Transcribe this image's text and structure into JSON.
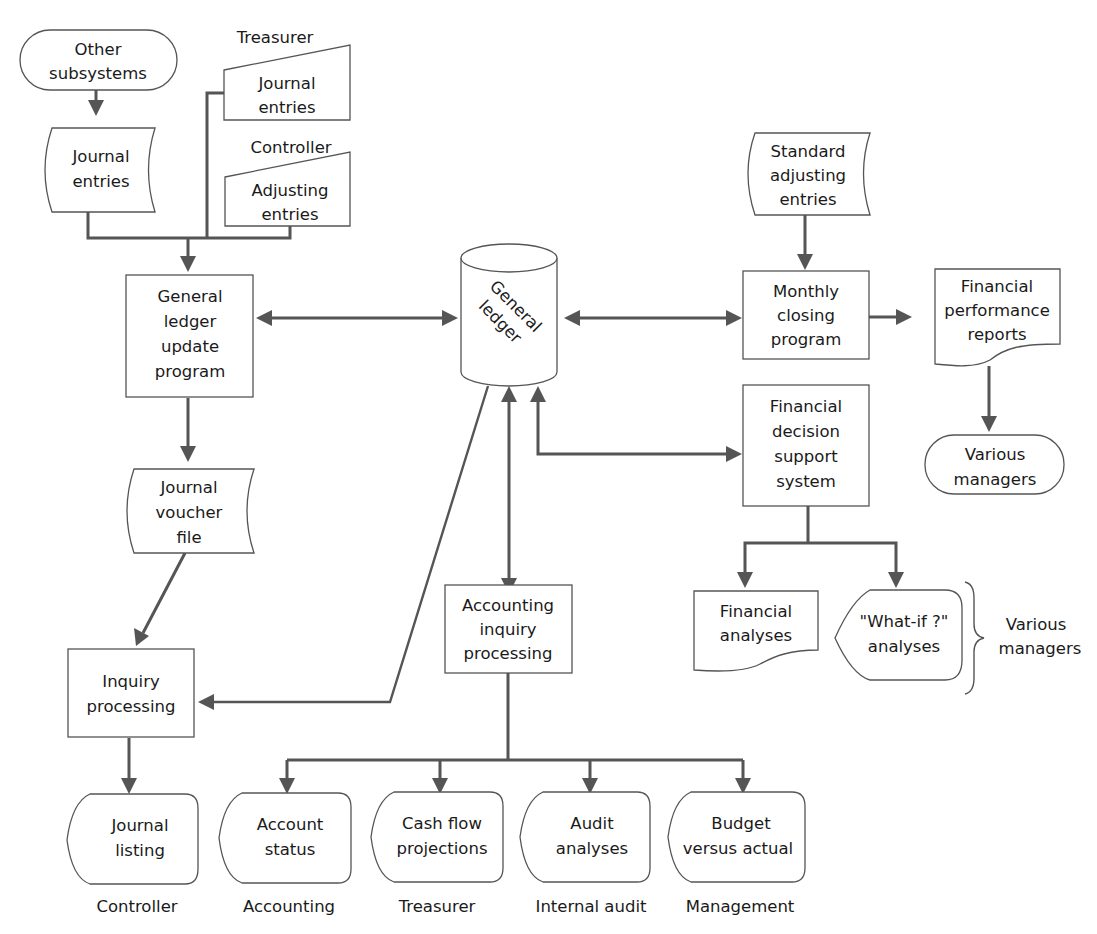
{
  "diagram": {
    "type": "flowchart",
    "colors": {
      "line": "#555555",
      "text": "#1a1a1a",
      "background": "#ffffff"
    },
    "nodes": {
      "other_subsystems": {
        "shape": "terminal",
        "lines": [
          "Other",
          "subsystems"
        ]
      },
      "journal_entries_left": {
        "shape": "stored-data",
        "lines": [
          "Journal",
          "entries"
        ]
      },
      "treasurer_label": {
        "shape": "label",
        "lines": [
          "Treasurer"
        ]
      },
      "treasurer_journal_entries": {
        "shape": "manual-input",
        "lines": [
          "Journal",
          "entries"
        ]
      },
      "controller_label": {
        "shape": "label",
        "lines": [
          "Controller"
        ]
      },
      "controller_adjusting_entries": {
        "shape": "manual-input",
        "lines": [
          "Adjusting",
          "entries"
        ]
      },
      "gl_update_program": {
        "shape": "process",
        "lines": [
          "General",
          "ledger",
          "update",
          "program"
        ]
      },
      "general_ledger": {
        "shape": "database",
        "lines": [
          "General",
          "ledger"
        ]
      },
      "standard_adjusting_entries": {
        "shape": "stored-data",
        "lines": [
          "Standard",
          "adjusting",
          "entries"
        ]
      },
      "monthly_closing_program": {
        "shape": "process",
        "lines": [
          "Monthly",
          "closing",
          "program"
        ]
      },
      "financial_performance_reports": {
        "shape": "document",
        "lines": [
          "Financial",
          "performance",
          "reports"
        ]
      },
      "various_managers_top": {
        "shape": "terminal",
        "lines": [
          "Various",
          "managers"
        ]
      },
      "financial_dss": {
        "shape": "process",
        "lines": [
          "Financial",
          "decision",
          "support",
          "system"
        ]
      },
      "financial_analyses": {
        "shape": "document",
        "lines": [
          "Financial",
          "analyses"
        ]
      },
      "what_if_analyses": {
        "shape": "display",
        "lines": [
          "\"What-if ?\"",
          "analyses"
        ]
      },
      "various_managers_brace": {
        "shape": "label",
        "lines": [
          "Various",
          "managers"
        ]
      },
      "journal_voucher_file": {
        "shape": "stored-data",
        "lines": [
          "Journal",
          "voucher",
          "file"
        ]
      },
      "inquiry_processing": {
        "shape": "process",
        "lines": [
          "Inquiry",
          "processing"
        ]
      },
      "accounting_inquiry_processing": {
        "shape": "process",
        "lines": [
          "Accounting",
          "inquiry",
          "processing"
        ]
      },
      "journal_listing": {
        "shape": "display",
        "lines": [
          "Journal",
          "listing"
        ],
        "recipient": "Controller"
      },
      "account_status": {
        "shape": "display",
        "lines": [
          "Account",
          "status"
        ],
        "recipient": "Accounting"
      },
      "cash_flow_projections": {
        "shape": "display",
        "lines": [
          "Cash flow",
          "projections"
        ],
        "recipient": "Treasurer"
      },
      "audit_analyses": {
        "shape": "display",
        "lines": [
          "Audit",
          "analyses"
        ],
        "recipient": "Internal audit"
      },
      "budget_versus_actual": {
        "shape": "display",
        "lines": [
          "Budget",
          "versus actual"
        ],
        "recipient": "Management"
      }
    },
    "edges": [
      {
        "from": "other_subsystems",
        "to": "journal_entries_left",
        "direction": "forward"
      },
      {
        "from": "journal_entries_left",
        "to": "gl_update_program",
        "direction": "forward"
      },
      {
        "from": "treasurer_journal_entries",
        "to": "gl_update_program",
        "direction": "forward"
      },
      {
        "from": "controller_adjusting_entries",
        "to": "gl_update_program",
        "direction": "forward"
      },
      {
        "from": "gl_update_program",
        "to": "general_ledger",
        "direction": "both"
      },
      {
        "from": "gl_update_program",
        "to": "journal_voucher_file",
        "direction": "forward"
      },
      {
        "from": "journal_voucher_file",
        "to": "inquiry_processing",
        "direction": "forward"
      },
      {
        "from": "general_ledger",
        "to": "inquiry_processing",
        "direction": "forward"
      },
      {
        "from": "general_ledger",
        "to": "monthly_closing_program",
        "direction": "both"
      },
      {
        "from": "standard_adjusting_entries",
        "to": "monthly_closing_program",
        "direction": "forward"
      },
      {
        "from": "monthly_closing_program",
        "to": "financial_performance_reports",
        "direction": "forward"
      },
      {
        "from": "financial_performance_reports",
        "to": "various_managers_top",
        "direction": "forward"
      },
      {
        "from": "general_ledger",
        "to": "financial_dss",
        "direction": "both"
      },
      {
        "from": "financial_dss",
        "to": "financial_analyses",
        "direction": "forward"
      },
      {
        "from": "financial_dss",
        "to": "what_if_analyses",
        "direction": "forward"
      },
      {
        "from": "general_ledger",
        "to": "accounting_inquiry_processing",
        "direction": "both"
      },
      {
        "from": "inquiry_processing",
        "to": "journal_listing",
        "direction": "forward"
      },
      {
        "from": "accounting_inquiry_processing",
        "to": "account_status",
        "direction": "forward"
      },
      {
        "from": "accounting_inquiry_processing",
        "to": "cash_flow_projections",
        "direction": "forward"
      },
      {
        "from": "accounting_inquiry_processing",
        "to": "audit_analyses",
        "direction": "forward"
      },
      {
        "from": "accounting_inquiry_processing",
        "to": "budget_versus_actual",
        "direction": "forward"
      }
    ]
  }
}
